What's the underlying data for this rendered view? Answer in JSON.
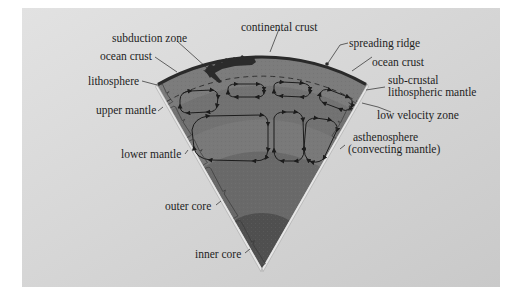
{
  "diagram": {
    "colors": {
      "background_panel": "#d6d6d6",
      "background_outer": "#ffffff",
      "crust": "#2e2e2e",
      "lithosphere": "#7a7a7a",
      "upper_mantle": "#6e6e6e",
      "lower_mantle": "#747474",
      "outer_core": "#666666",
      "inner_core": "#4e4e4e",
      "edge_band": "#e4e4e4",
      "text": "#1e1e1e"
    },
    "labels_left": [
      {
        "id": "subduction-zone",
        "text": "subduction zone"
      },
      {
        "id": "ocean-crust-left",
        "text": "ocean crust"
      },
      {
        "id": "lithosphere",
        "text": "lithosphere"
      },
      {
        "id": "upper-mantle",
        "text": "upper mantle"
      },
      {
        "id": "lower-mantle",
        "text": "lower mantle"
      },
      {
        "id": "outer-core",
        "text": "outer core"
      },
      {
        "id": "inner-core",
        "text": "inner core"
      }
    ],
    "labels_right": [
      {
        "id": "continental-crust",
        "text": "continental crust"
      },
      {
        "id": "spreading-ridge",
        "text": "spreading ridge"
      },
      {
        "id": "ocean-crust-right",
        "text": "ocean crust"
      },
      {
        "id": "sub-crustal-1",
        "text": "sub-crustal"
      },
      {
        "id": "sub-crustal-2",
        "text": "lithospheric mantle"
      },
      {
        "id": "low-velocity-zone",
        "text": "low velocity zone"
      },
      {
        "id": "asthenosphere-1",
        "text": "asthenosphere"
      },
      {
        "id": "asthenosphere-2",
        "text": "(convecting mantle)"
      }
    ]
  }
}
